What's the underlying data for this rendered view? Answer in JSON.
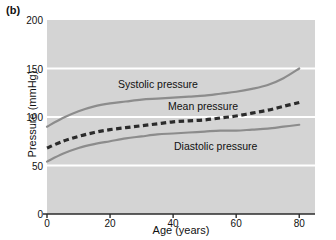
{
  "panel": {
    "label": "(b)"
  },
  "chart_data": {
    "type": "line",
    "title": "",
    "subtitle": "",
    "xlabel": "Age (years)",
    "ylabel": "Pressure (mmHg)",
    "xlim": [
      0,
      85
    ],
    "ylim": [
      0,
      200
    ],
    "xticks": [
      0,
      20,
      40,
      60,
      80
    ],
    "xtick_labels": [
      "0",
      "20",
      "40",
      "60",
      "80"
    ],
    "yticks": [
      0,
      50,
      100,
      150,
      200
    ],
    "ytick_labels": [
      "0",
      "50",
      "100",
      "150",
      "200"
    ],
    "grid": "horizontal-white-gridlines-at-50-100-150",
    "legend": "inline-curve-annotations",
    "plot_background": "#d4d4d4",
    "gridline_color": "#ffffff",
    "axis_color": "#2b2b2b",
    "curve_color": "#8c8c8c",
    "x": [
      0,
      5,
      10,
      15,
      20,
      25,
      30,
      35,
      40,
      45,
      50,
      55,
      60,
      65,
      70,
      75,
      80
    ],
    "series": [
      {
        "name": "Systolic pressure",
        "style": "solid",
        "color": "#8c8c8c",
        "annotation": "Systolic pressure",
        "values": [
          90,
          99,
          106,
          111,
          114,
          116,
          118,
          119,
          120,
          121,
          122,
          124,
          126,
          129,
          133,
          140,
          150
        ]
      },
      {
        "name": "Mean pressure",
        "style": "dashed",
        "color": "#2b2b2b",
        "annotation": "Mean pressure",
        "values": [
          68,
          75,
          80,
          84,
          87,
          89,
          91,
          93,
          95,
          96,
          97,
          99,
          101,
          104,
          107,
          111,
          115
        ]
      },
      {
        "name": "Diastolic pressure",
        "style": "solid",
        "color": "#8c8c8c",
        "annotation": "Diastolic pressure",
        "values": [
          54,
          62,
          68,
          72,
          75,
          78,
          80,
          82,
          83,
          84,
          85,
          86,
          86,
          87,
          88,
          90,
          92
        ]
      }
    ]
  }
}
